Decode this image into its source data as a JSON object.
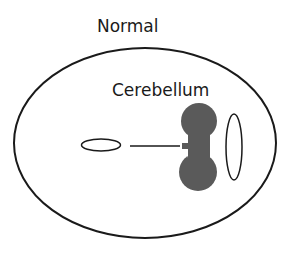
{
  "title": "Normal",
  "labels": {
    "cerebellum": "Cerebellum"
  },
  "colors": {
    "stroke": "#1a1a1a",
    "cerebellum_fill": "#5a5a5a",
    "background": "#ffffff"
  }
}
